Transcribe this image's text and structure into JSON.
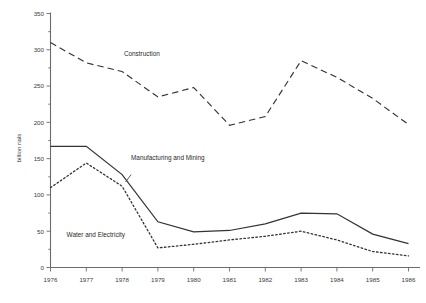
{
  "chart_data": {
    "type": "line",
    "title": "",
    "subtitle": "",
    "xlabel": "",
    "ylabel": "billion rials",
    "x": [
      1976,
      1977,
      1978,
      1979,
      1980,
      1981,
      1982,
      1983,
      1984,
      1985,
      1986
    ],
    "xtick_labels": [
      "1976",
      "1977",
      "1978",
      "1979",
      "1980",
      "1981",
      "1982",
      "1983",
      "1984",
      "1985",
      "1986"
    ],
    "ytick_labels": [
      "0",
      "50",
      "100",
      "150",
      "200",
      "250",
      "300",
      "350"
    ],
    "yticks": [
      0,
      50,
      100,
      150,
      200,
      250,
      300,
      350
    ],
    "ylim": [
      0,
      350
    ],
    "xlim": [
      1976,
      1986
    ],
    "grid": false,
    "legend_position": "inline-annotations",
    "series": [
      {
        "name": "Construction",
        "style": "dashed",
        "color": "#333333",
        "values": [
          310,
          282,
          270,
          235,
          248,
          196,
          208,
          285,
          262,
          233,
          197
        ],
        "label_x": 1978.05,
        "label_y": 292
      },
      {
        "name": "Manufacturing and Mining",
        "style": "solid",
        "color": "#333333",
        "values": [
          167,
          167,
          128,
          63,
          49,
          51,
          60,
          75,
          74,
          46,
          33
        ],
        "label_x": 1978.25,
        "label_y": 148
      },
      {
        "name": "Water and Electricity",
        "style": "dotted",
        "color": "#333333",
        "values": [
          110,
          144,
          112,
          27,
          32,
          38,
          43,
          50,
          38,
          22,
          16
        ],
        "label_x": 1976.45,
        "label_y": 42
      }
    ],
    "annotations": [
      {
        "text": "Construction",
        "name": "series-label-construction"
      },
      {
        "text": "Manufacturing and Mining",
        "name": "series-label-manufacturing-and-mining"
      },
      {
        "text": "Water and Electricity",
        "name": "series-label-water-and-electricity"
      }
    ]
  }
}
